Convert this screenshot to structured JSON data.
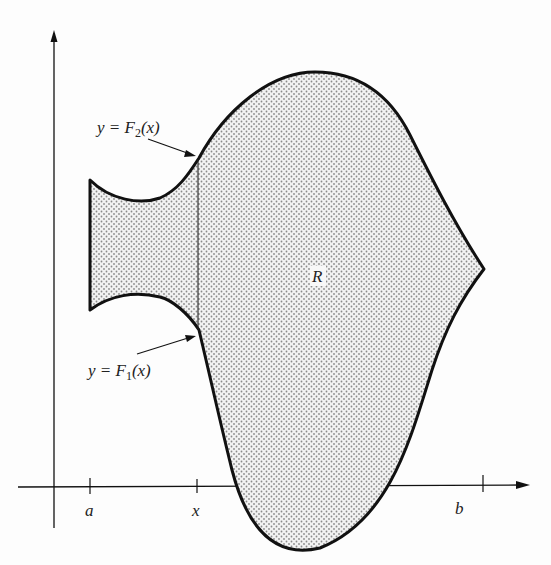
{
  "diagram": {
    "type": "region-between-curves",
    "colors": {
      "background": "#fdfdfd",
      "stroke": "#111111",
      "fill_dots": "#8a8a8a"
    },
    "labels": {
      "upper_curve": {
        "prefix": "y = F",
        "sub": "2",
        "suffix": "(x)"
      },
      "lower_curve": {
        "prefix": "y = F",
        "sub": "1",
        "suffix": "(x)"
      },
      "region": "R",
      "tick_a": "a",
      "tick_x": "x",
      "tick_b": "b"
    },
    "axes": {
      "x_axis": "horizontal with arrow at right",
      "y_axis": "vertical with arrow at top"
    }
  }
}
